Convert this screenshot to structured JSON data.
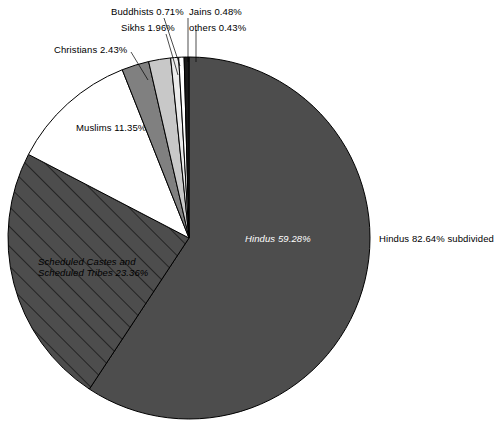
{
  "chart_data": {
    "type": "pie",
    "title": "",
    "subtitle": "",
    "xlabel": "",
    "ylabel": "",
    "legend_position": "none",
    "grid": false,
    "units": "percent",
    "start_angle_deg": 0,
    "direction": "clockwise",
    "center": {
      "x": 189,
      "y": 238
    },
    "radius": 181,
    "categories": [
      "Hindus",
      "Scheduled Castes and Scheduled Tribes",
      "Muslims",
      "Christians",
      "Sikhs",
      "Buddhists",
      "Jains",
      "others"
    ],
    "values": [
      59.28,
      23.36,
      11.35,
      2.43,
      1.96,
      0.71,
      0.48,
      0.43
    ],
    "slices": [
      {
        "name": "Hindus",
        "value": 59.28,
        "label": "Hindus  59.28%",
        "color": "#4d4d4d",
        "pattern": "solid",
        "label_style": "italic-white-inside"
      },
      {
        "name": "Scheduled Castes and Scheduled Tribes",
        "value": 23.36,
        "label": "Scheduled Castes and\nScheduled Tribes 23.36%",
        "color": "#4d4d4d",
        "pattern": "diagonal-hatch",
        "label_style": "italic-inside"
      },
      {
        "name": "Muslims",
        "value": 11.35,
        "label": "Muslims 11.35%",
        "color": "#ffffff",
        "pattern": "solid",
        "label_style": "inside"
      },
      {
        "name": "Christians",
        "value": 2.43,
        "label": "Christians 2.43%",
        "color": "#808080",
        "pattern": "solid",
        "label_style": "leader-outside"
      },
      {
        "name": "Sikhs",
        "value": 1.96,
        "label": "Sikhs 1.96%",
        "color": "#c8c8c8",
        "pattern": "solid",
        "label_style": "leader-outside"
      },
      {
        "name": "Buddhists",
        "value": 0.71,
        "label": "Buddhists 0.71%",
        "color": "#ebebeb",
        "pattern": "solid",
        "label_style": "leader-outside"
      },
      {
        "name": "Jains",
        "value": 0.48,
        "label": "Jains 0.48%",
        "color": "#ffffff",
        "pattern": "solid",
        "label_style": "leader-outside"
      },
      {
        "name": "others",
        "value": 0.43,
        "label": "others 0.43%",
        "color": "#1a1a1a",
        "pattern": "solid",
        "label_style": "leader-outside"
      }
    ],
    "annotations": [
      {
        "name": "hindus-subdivided-note",
        "text": "Hindus 82.64% subdivided",
        "describes": [
          "Hindus",
          "Scheduled Castes and Scheduled Tribes"
        ],
        "total": 82.64
      }
    ]
  },
  "labels": {
    "buddhists": "Buddhists 0.71%",
    "jains": "Jains 0.48%",
    "sikhs": "Sikhs 1.96%",
    "others": "others 0.43%",
    "christians": "Christians 2.43%",
    "muslims": "Muslims 11.35%",
    "hindus_inner": "Hindus  59.28%",
    "hindus_subdivided": "Hindus 82.64% subdivided",
    "sc_st_line1": "Scheduled Castes and",
    "sc_st_line2": "Scheduled Tribes 23.36%"
  },
  "colors": {
    "hindus": "#4d4d4d",
    "sc_st": "#4d4d4d",
    "muslims": "#ffffff",
    "christians": "#808080",
    "sikhs": "#c8c8c8",
    "buddhists": "#ebebeb",
    "jains": "#ffffff",
    "others": "#1a1a1a",
    "outline": "#000000",
    "background": "#ffffff"
  }
}
